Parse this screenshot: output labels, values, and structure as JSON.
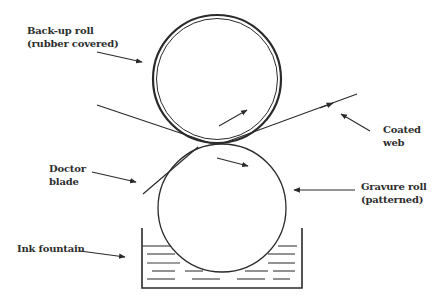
{
  "diagram": {
    "type": "gravure coating schematic",
    "colors": {
      "line": "#2a2a2a",
      "text": "#2e2e2e",
      "background": "#ffffff"
    },
    "labels": {
      "backup_roll": {
        "line1": "Back-up roll",
        "line2": "(rubber covered)"
      },
      "coated_web": {
        "line1": "Coated",
        "line2": "web"
      },
      "doctor_blade": {
        "line1": "Doctor",
        "line2": "blade"
      },
      "gravure_roll": {
        "line1": "Gravure roll",
        "line2": "(patterned)"
      },
      "ink_fountain": {
        "line1": "Ink fountain"
      }
    },
    "components": [
      {
        "name": "Back-up roll",
        "shape": "double circle",
        "center": [
          217,
          79
        ],
        "radius": 64
      },
      {
        "name": "Gravure roll",
        "shape": "circle",
        "center": [
          222,
          208
        ],
        "radius": 64
      },
      {
        "name": "Web",
        "shape": "line",
        "from": [
          97,
          105
        ],
        "to": [
          357,
          94
        ]
      },
      {
        "name": "Doctor blade",
        "shape": "line",
        "from": [
          143,
          194
        ],
        "to": [
          198,
          147
        ]
      },
      {
        "name": "Ink fountain",
        "shape": "open tank",
        "left": 142,
        "right": 302,
        "top": 228,
        "bottom": 288
      }
    ]
  }
}
